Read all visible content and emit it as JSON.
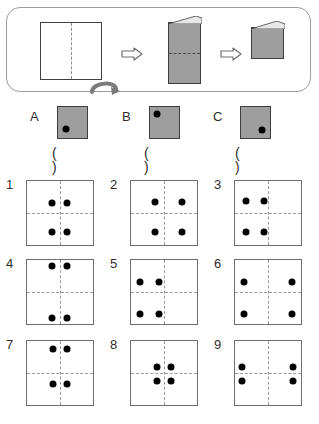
{
  "puzzle": {
    "type": "paper-folding-punch",
    "fold_sequence": {
      "step1": {
        "label": "flat square sheet with vertical fold line",
        "fold_line": "vertical-center",
        "fold_direction": "bottom-up-curl"
      },
      "step2": {
        "label": "sheet folded in half vertically, horizontal fold line",
        "fold_line": "horizontal-center",
        "fold_direction": "left-curl"
      },
      "step3": {
        "label": "final folded quarter square"
      },
      "arrow_glyph": "⇒"
    },
    "options": [
      {
        "letter": "A",
        "dot": {
          "x": 27,
          "y": 72
        },
        "answer_blank": "(      )"
      },
      {
        "letter": "B",
        "dot": {
          "x": 25,
          "y": 24
        },
        "answer_blank": "(      )"
      },
      {
        "letter": "C",
        "dot": {
          "x": 74,
          "y": 74
        },
        "answer_blank": "(      )"
      }
    ],
    "answers": [
      {
        "number": "1",
        "dots": [
          {
            "x": 38,
            "y": 34
          },
          {
            "x": 60,
            "y": 34
          },
          {
            "x": 38,
            "y": 79
          },
          {
            "x": 60,
            "y": 79
          }
        ]
      },
      {
        "number": "2",
        "dots": [
          {
            "x": 36,
            "y": 33
          },
          {
            "x": 78,
            "y": 33
          },
          {
            "x": 36,
            "y": 80
          },
          {
            "x": 78,
            "y": 80
          }
        ]
      },
      {
        "number": "3",
        "dots": [
          {
            "x": 17,
            "y": 32
          },
          {
            "x": 44,
            "y": 32
          },
          {
            "x": 17,
            "y": 80
          },
          {
            "x": 44,
            "y": 80
          }
        ]
      },
      {
        "number": "4",
        "dots": [
          {
            "x": 38,
            "y": 10
          },
          {
            "x": 60,
            "y": 10
          },
          {
            "x": 38,
            "y": 90
          },
          {
            "x": 60,
            "y": 90
          }
        ]
      },
      {
        "number": "5",
        "dots": [
          {
            "x": 14,
            "y": 35
          },
          {
            "x": 42,
            "y": 35
          },
          {
            "x": 14,
            "y": 84
          },
          {
            "x": 42,
            "y": 84
          }
        ]
      },
      {
        "number": "6",
        "dots": [
          {
            "x": 13,
            "y": 34
          },
          {
            "x": 87,
            "y": 34
          },
          {
            "x": 13,
            "y": 84
          },
          {
            "x": 87,
            "y": 84
          }
        ]
      },
      {
        "number": "7",
        "dots": [
          {
            "x": 39,
            "y": 12
          },
          {
            "x": 60,
            "y": 12
          },
          {
            "x": 39,
            "y": 67
          },
          {
            "x": 60,
            "y": 67
          }
        ]
      },
      {
        "number": "8",
        "dots": [
          {
            "x": 39,
            "y": 40
          },
          {
            "x": 61,
            "y": 40
          },
          {
            "x": 39,
            "y": 63
          },
          {
            "x": 61,
            "y": 63
          }
        ]
      },
      {
        "number": "9",
        "dots": [
          {
            "x": 11,
            "y": 41
          },
          {
            "x": 88,
            "y": 41
          },
          {
            "x": 11,
            "y": 63
          },
          {
            "x": 88,
            "y": 63
          }
        ]
      }
    ]
  },
  "colors": {
    "paper_gray": "#9e9e9e",
    "dot_black": "#000000",
    "line_gray": "#9a9a9a",
    "border_dark": "#3d3d3d"
  }
}
